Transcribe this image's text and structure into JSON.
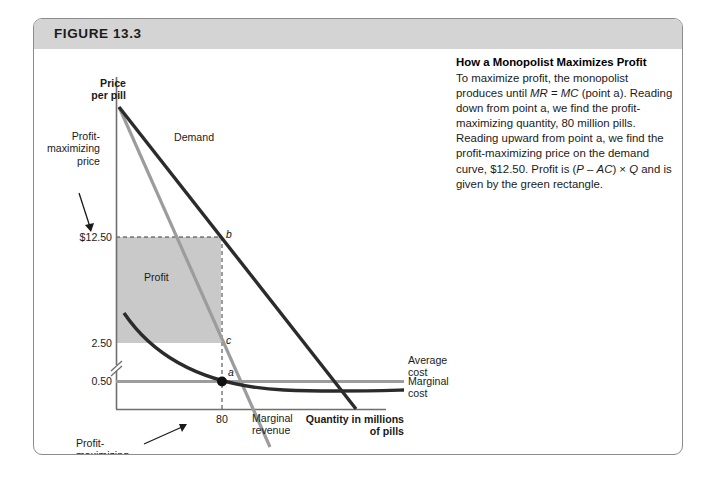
{
  "figure": {
    "number_label": "FIGURE 13.3"
  },
  "caption": {
    "title": "How a Monopolist Maximizes Profit",
    "body_segments": [
      {
        "text": "To maximize profit, the monopolist produces until ",
        "italic": false
      },
      {
        "text": "MR",
        "italic": true
      },
      {
        "text": " = ",
        "italic": false
      },
      {
        "text": "MC",
        "italic": true
      },
      {
        "text": " (point a). Reading down from point a, we find the profit-maximizing quantity, 80 million pills. Reading upward from point a, we find the profit-maximizing price on the demand curve, $12.50. Profit is (",
        "italic": false
      },
      {
        "text": "P",
        "italic": true
      },
      {
        "text": " – ",
        "italic": false
      },
      {
        "text": "AC",
        "italic": true
      },
      {
        "text": ") × ",
        "italic": false
      },
      {
        "text": "Q",
        "italic": true
      },
      {
        "text": " and is given by the green rectangle.",
        "italic": false
      }
    ]
  },
  "chart_data": {
    "type": "line",
    "title": "How a Monopolist Maximizes Profit",
    "xlabel": "Quantity in millions of pills",
    "ylabel": "Price per pill",
    "grid": false,
    "legend": "inline-curve-labels",
    "y_axis_has_break": true,
    "y_tick_labels": [
      "$12.50",
      "2.50",
      "0.50"
    ],
    "x_tick_labels": [
      "80"
    ],
    "axis_titles": {
      "y_line1": "Price",
      "y_line2": "per pill",
      "x_line1": "Quantity in millions",
      "x_line2": "of pills"
    },
    "annotations": [
      {
        "name": "profit-maximizing-price",
        "text_line1": "Profit-",
        "text_line2": "maximizing",
        "text_line3": "price",
        "points_to": "$12.50"
      },
      {
        "name": "profit-maximizing-quantity",
        "text_line1": "Profit-",
        "text_line2": "maximizing",
        "text_line3": "quantity",
        "points_to": "80"
      },
      {
        "name": "profit-rectangle-label",
        "text": "Profit"
      }
    ],
    "points": [
      {
        "label": "a",
        "description": "MR = MC intersection",
        "quantity": 80,
        "price": 0.5
      },
      {
        "label": "b",
        "description": "demand curve at profit-maximizing quantity",
        "quantity": 80,
        "price": 12.5
      },
      {
        "label": "c",
        "description": "average cost at profit-maximizing quantity",
        "quantity": 80,
        "price": 2.5
      }
    ],
    "series": [
      {
        "name": "Demand",
        "label": "Demand",
        "color": "#2b2b2b",
        "type": "line"
      },
      {
        "name": "Marginal revenue",
        "label_line1": "Marginal",
        "label_line2": "revenue",
        "color": "#9c9c9c",
        "type": "line"
      },
      {
        "name": "Average cost",
        "label": "Average cost",
        "color": "#2b2b2b",
        "type": "curve"
      },
      {
        "name": "Marginal cost",
        "label": "Marginal cost",
        "color": "#9c9c9c",
        "type": "line"
      }
    ],
    "profit_rectangle": {
      "label": "Profit",
      "color": "#c9c9c9",
      "price_top": 12.5,
      "price_bottom": 2.5,
      "quantity_right": 80
    }
  },
  "colors": {
    "header_bar": "#d4d4d4",
    "card_border": "#8c8c8c",
    "dark_curve": "#2b2b2b",
    "gray_curve": "#9c9c9c",
    "profit_fill": "#c9c9c9",
    "axis": "#6e6e6e",
    "text": "#1a1a1a"
  }
}
